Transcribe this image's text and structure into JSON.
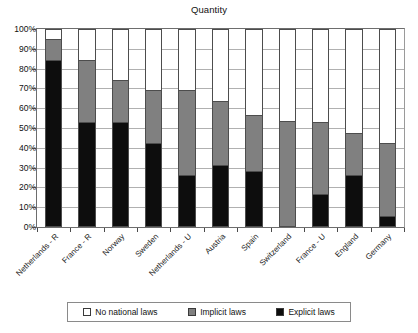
{
  "chart_data": {
    "type": "bar",
    "subtype": "stacked-100-percent",
    "title": "Quantity",
    "xlabel": "",
    "ylabel": "",
    "ylim": [
      0,
      100
    ],
    "ytick_labels": [
      "100%",
      "90%",
      "80%",
      "70%",
      "60%",
      "50%",
      "40%",
      "30%",
      "20%",
      "10%",
      "0%"
    ],
    "ytick_values": [
      100,
      90,
      80,
      70,
      60,
      50,
      40,
      30,
      20,
      10,
      0
    ],
    "grid": true,
    "legend_position": "bottom",
    "categories": [
      "Netherlands - R",
      "France - R",
      "Norway",
      "Sweden",
      "Netherlands - U",
      "Austria",
      "Spain",
      "Switzerland",
      "France - U",
      "England",
      "Germany"
    ],
    "series": [
      {
        "name": "No national laws",
        "color": "#ffffff",
        "values": [
          5.5,
          16,
          26.5,
          31.5,
          31.5,
          37,
          44,
          47,
          47.5,
          53,
          58
        ]
      },
      {
        "name": "Implicit laws",
        "color": "#808080",
        "values": [
          10.5,
          31.5,
          21,
          26.5,
          42.5,
          32,
          28,
          53,
          36.5,
          21,
          37
        ]
      },
      {
        "name": "Explicit laws",
        "color": "#0d0d0d",
        "values": [
          84,
          52.5,
          52.5,
          42,
          26,
          31,
          28,
          0,
          16,
          26,
          5
        ]
      }
    ],
    "cumulative_tops": {
      "explicit": [
        84,
        52.5,
        52.5,
        42,
        26,
        31,
        28,
        0,
        16,
        26,
        5
      ],
      "implicit": [
        94.5,
        84,
        73.5,
        68.5,
        68.5,
        63,
        56,
        53,
        52.5,
        47,
        42
      ]
    }
  },
  "legend": {
    "items": [
      {
        "label": "No national laws",
        "swatch": "white-square-icon"
      },
      {
        "label": "Implicit laws",
        "swatch": "gray-square-icon"
      },
      {
        "label": "Explicit laws",
        "swatch": "black-square-icon"
      }
    ]
  },
  "colors": {
    "explicit": "#0d0d0d",
    "implicit": "#808080",
    "none": "#ffffff",
    "grid": "#b0b0b0",
    "axis": "#4a4a4a",
    "border": "#6d6d6d"
  }
}
